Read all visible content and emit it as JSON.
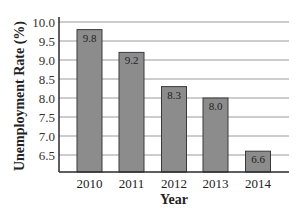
{
  "chart_data": {
    "type": "bar",
    "title": "",
    "xlabel": "Year",
    "ylabel": "Unemployment Rate (%)",
    "categories": [
      "2010",
      "2011",
      "2012",
      "2013",
      "2014"
    ],
    "values": [
      9.8,
      9.2,
      8.3,
      8.0,
      6.6
    ],
    "data_labels": [
      "9.8",
      "9.2",
      "8.3",
      "8.0",
      "6.6"
    ],
    "yticks": [
      "10.0",
      "9.5",
      "9.0",
      "8.5",
      "8.0",
      "7.5",
      "7.0",
      "6.5"
    ],
    "ytick_values": [
      10.0,
      9.5,
      9.0,
      8.5,
      8.0,
      7.5,
      7.0,
      6.5
    ],
    "ylim": [
      6.05,
      10.0
    ],
    "grid": true,
    "legend": null
  },
  "colors": {
    "bar_fill": "#8c8c8c",
    "bar_stroke": "#3a3a3a",
    "grid": "#9a9a9a",
    "axis": "#2a2a2a"
  }
}
